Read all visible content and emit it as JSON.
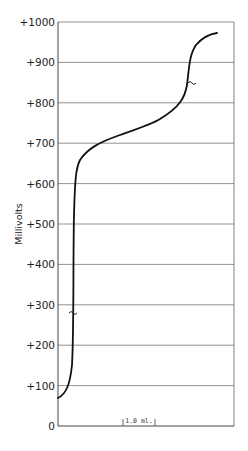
{
  "chart_data": {
    "type": "line",
    "title": "",
    "xlabel": "",
    "ylabel": "Millivolts",
    "ylim": [
      0,
      1000
    ],
    "yticks": [
      0,
      100,
      200,
      300,
      400,
      500,
      600,
      700,
      800,
      900,
      1000
    ],
    "ytick_labels": [
      "0",
      "+100",
      "+200",
      "+300",
      "+400",
      "+500",
      "+600",
      "+700",
      "+800",
      "+900",
      "+1000"
    ],
    "grid": true,
    "legend": null,
    "x_scale_bar": {
      "label": "1.0 ml.",
      "length_ml": 1.0
    },
    "annotations": [
      {
        "type": "squiggle",
        "near_y_mV": 350,
        "description": "midpoint marker on first rise"
      },
      {
        "type": "squiggle",
        "near_y_mV": 845,
        "description": "midpoint marker on second rise"
      }
    ],
    "series": [
      {
        "name": "Titration curve",
        "x_ml_approx": [
          0.0,
          0.2,
          0.3,
          0.38,
          0.42,
          0.44,
          0.5,
          0.7,
          1.0,
          1.5,
          2.0,
          2.4,
          2.9,
          3.2,
          3.4,
          3.5,
          3.6,
          3.7,
          3.9,
          4.3,
          4.9
        ],
        "values_mV": [
          70,
          100,
          200,
          300,
          400,
          500,
          580,
          620,
          640,
          660,
          675,
          690,
          700,
          730,
          780,
          840,
          880,
          900,
          930,
          955,
          970
        ]
      }
    ]
  }
}
